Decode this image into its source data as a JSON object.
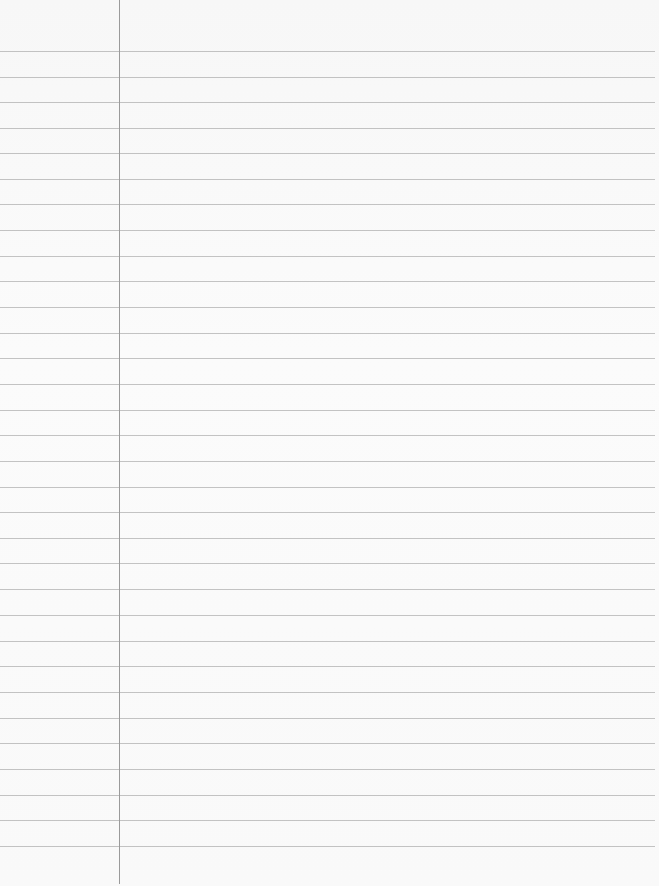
{
  "page": {
    "type": "lined-notebook-paper",
    "width": 659,
    "height": 886,
    "paper_color": "#f9f9f9",
    "line_color": "#b9b9b9",
    "margin_line_color": "#9a9a9a"
  },
  "margin_line": {
    "x": 119,
    "bottom": 884
  },
  "ruled_lines": {
    "count": 32,
    "first_y": 51,
    "spacing": 25.5,
    "right_end_x": 655,
    "positions": [
      51,
      77,
      102,
      128,
      153,
      179,
      204,
      230,
      256,
      281,
      307,
      333,
      358,
      384,
      410,
      435,
      461,
      487,
      512,
      538,
      563,
      589,
      615,
      641,
      666,
      692,
      718,
      743,
      769,
      795,
      820,
      846
    ]
  },
  "content": {
    "text": ""
  }
}
